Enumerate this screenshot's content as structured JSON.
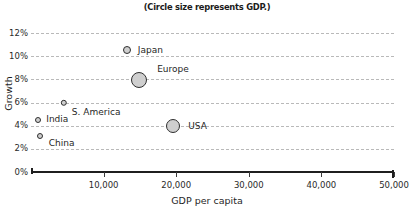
{
  "chart_data": {
    "type": "scatter",
    "title": "(Circle size represents GDP.)",
    "xlabel": "GDP per capita",
    "ylabel": "Growth",
    "xlim": [
      0,
      50000
    ],
    "ylim": [
      0,
      12
    ],
    "grid": true,
    "legend": "none",
    "size_note": "Circle size represents GDP.",
    "xticks": [
      {
        "value": 0,
        "label": ""
      },
      {
        "value": 10000,
        "label": "10,000"
      },
      {
        "value": 20000,
        "label": "20,000"
      },
      {
        "value": 30000,
        "label": "30,000"
      },
      {
        "value": 40000,
        "label": "40,000"
      },
      {
        "value": 50000,
        "label": "50,000"
      }
    ],
    "yticks": [
      {
        "value": 0,
        "label": "0%"
      },
      {
        "value": 2,
        "label": "2%"
      },
      {
        "value": 4,
        "label": "4%"
      },
      {
        "value": 6,
        "label": "6%"
      },
      {
        "value": 8,
        "label": "8%"
      },
      {
        "value": 10,
        "label": "10%"
      },
      {
        "value": 12,
        "label": "12%"
      }
    ],
    "points": [
      {
        "name": "Japan",
        "x": 13200,
        "y": 10.5,
        "r": 4.0,
        "label_dx": 7,
        "label_dy": 0
      },
      {
        "name": "Europe",
        "x": 14900,
        "y": 7.9,
        "r": 8.0,
        "label_dx": 10,
        "label_dy": -11
      },
      {
        "name": "USA",
        "x": 19600,
        "y": 4.0,
        "r": 7.0,
        "label_dx": 8,
        "label_dy": 0
      },
      {
        "name": "S. America",
        "x": 4500,
        "y": 6.0,
        "r": 3.2,
        "label_dx": 5,
        "label_dy": 9
      },
      {
        "name": "India",
        "x": 1000,
        "y": 4.5,
        "r": 3.0,
        "label_dx": 5,
        "label_dy": -1
      },
      {
        "name": "China",
        "x": 1200,
        "y": 3.1,
        "r": 3.0,
        "label_dx": 6,
        "label_dy": 7
      }
    ]
  },
  "colors": {
    "bubble_fill": "#cfcfcf",
    "bubble_stroke": "#2f2f2f",
    "gridline": "#b9b9b9",
    "axis": "#1f1f1f",
    "text": "#1f1f1f",
    "background": "#ffffff"
  }
}
